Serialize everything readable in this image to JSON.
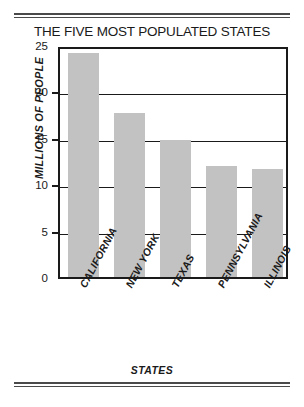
{
  "chart_data": {
    "type": "bar",
    "title": "THE FIVE MOST POPULATED STATES",
    "xlabel": "STATES",
    "ylabel": "MILLIONS OF PEOPLE",
    "categories": [
      "CALIFORNIA",
      "NEW YORK",
      "TEXAS",
      "PENNSYLVANIA",
      "ILLINOIS"
    ],
    "values": [
      24.1,
      17.7,
      14.8,
      12.0,
      11.6
    ],
    "ylim": [
      0,
      25
    ],
    "yticks": [
      0,
      5,
      10,
      15,
      20,
      25
    ],
    "ytick_labels": [
      "0",
      "5",
      "10",
      "15",
      "20",
      "25"
    ],
    "grid": true,
    "grid_axis": "y",
    "legend": false,
    "bar_color": "#c2c2c2",
    "axis_color": "#1a1a1a"
  }
}
